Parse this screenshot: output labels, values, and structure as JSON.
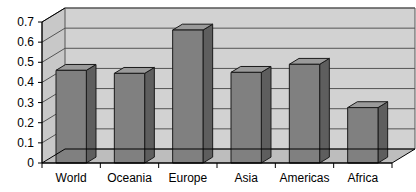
{
  "chart_data": {
    "type": "bar",
    "title": "",
    "xlabel": "",
    "ylabel": "",
    "categories": [
      "World",
      "Oceania",
      "Europe",
      "Asia",
      "Americas",
      "Africa"
    ],
    "values": [
      0.46,
      0.445,
      0.66,
      0.45,
      0.49,
      0.275
    ],
    "ylim": [
      0,
      0.7
    ],
    "ytick_labels": [
      "0",
      "0.1",
      "0.2",
      "0.3",
      "0.4",
      "0.5",
      "0.6",
      "0.7"
    ],
    "ytick_values": [
      0,
      0.1,
      0.2,
      0.3,
      0.4,
      0.5,
      0.6,
      0.7
    ],
    "grid": true,
    "legend": false,
    "style": "3d-column",
    "colors": {
      "bar_front": "#808080",
      "bar_side": "#5e5e5e",
      "bar_top": "#9a9a9a",
      "bar_outline": "#1a1a1a",
      "plot_back": "#d2d2d2",
      "plot_floor": "#bdbdbd",
      "plot_wall": "#c8c8c8",
      "gridline": "#55555 5",
      "axis": "#000000",
      "text": "#000000",
      "page_background": "#ffffff"
    }
  }
}
